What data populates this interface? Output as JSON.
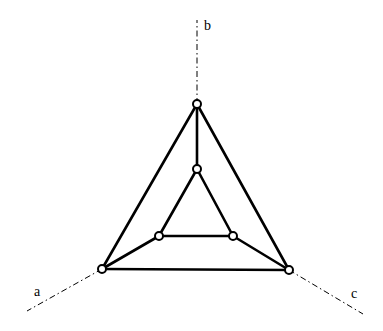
{
  "diagram": {
    "labels": {
      "a": "a",
      "b": "b",
      "c": "c"
    },
    "axes": [
      {
        "name": "b",
        "from": [
          197,
          104
        ],
        "to": [
          197,
          20
        ]
      },
      {
        "name": "a",
        "from": [
          102,
          269
        ],
        "to": [
          27,
          311
        ]
      },
      {
        "name": "c",
        "from": [
          289,
          270
        ],
        "to": [
          363,
          314
        ]
      }
    ],
    "nodes": [
      {
        "id": "outer-top",
        "x": 197,
        "y": 104
      },
      {
        "id": "outer-left",
        "x": 102,
        "y": 269
      },
      {
        "id": "outer-right",
        "x": 289,
        "y": 270
      },
      {
        "id": "inner-top",
        "x": 197,
        "y": 169
      },
      {
        "id": "inner-left",
        "x": 159,
        "y": 236
      },
      {
        "id": "inner-right",
        "x": 233,
        "y": 236
      }
    ],
    "edges": [
      [
        "outer-top",
        "outer-left"
      ],
      [
        "outer-top",
        "outer-right"
      ],
      [
        "outer-left",
        "outer-right"
      ],
      [
        "inner-top",
        "inner-left"
      ],
      [
        "inner-top",
        "inner-right"
      ],
      [
        "inner-left",
        "inner-right"
      ],
      [
        "outer-top",
        "inner-top"
      ],
      [
        "outer-left",
        "inner-left"
      ],
      [
        "outer-right",
        "inner-right"
      ]
    ]
  }
}
